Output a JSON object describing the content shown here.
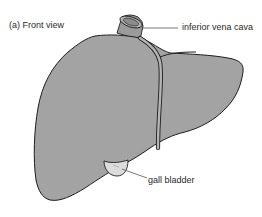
{
  "figure": {
    "panel_title": "(a) Front view",
    "labels": {
      "inferior_vena_cava": "inferior vena cava",
      "gall_bladder": "gall bladder"
    },
    "colors": {
      "liver_fill": "#a3a3a3",
      "outline": "#1e1e1e",
      "gall_bladder_fill": "#dcdcdc",
      "vena_cava_fill": "#9a9a9a",
      "leader_line": "#555555",
      "text": "#2a2a2a"
    }
  }
}
